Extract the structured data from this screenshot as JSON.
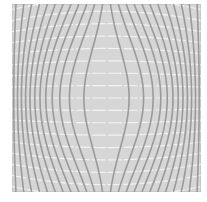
{
  "figure": {
    "background_color": "#d6d6d6",
    "border_color": "#b8b8b8",
    "vertical_line_color": "#9a9a9a",
    "horizontal_line_color": "#f2f2f2",
    "vertical_line_count": 24,
    "horizontal_line_count": 17,
    "vertical_line_width": 1.6,
    "horizontal_line_width": 1.2,
    "distortion": "barrel-pinch symmetric warp grid"
  },
  "caption": {
    "text": ""
  }
}
